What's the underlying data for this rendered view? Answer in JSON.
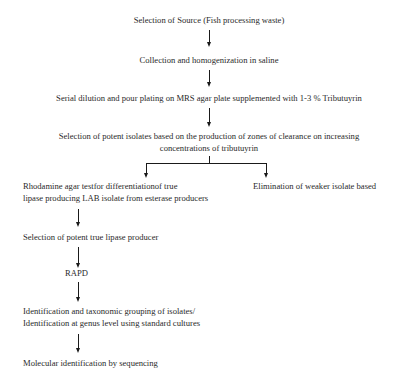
{
  "diagram": {
    "type": "flowchart",
    "nodes": {
      "source": "Selection of Source (Fish processing waste)",
      "collection": "Collection and homogenization in saline",
      "dilution": "Serial dilution and pour plating on MRS agar plate supplemented with 1-3 % Tributuyrin",
      "selection_line1": "Selection of potent isolates based on the production of zones of clearance on increasing",
      "selection_line2": "concentrations of tributuyrin",
      "rhodamine_line1": "Rhodamine agar testfor differentiationof true",
      "rhodamine_line2": "lipase producing LAB isolate from esterase producers",
      "elimination": "Elimination of weaker isolate based",
      "true_lipase": "Selection of potent true lipase producer",
      "rapd": "RAPD",
      "identification_line1": "Identification and taxonomic grouping of isolates/",
      "identification_line2": "Identification at genus level using standard cultures",
      "molecular": "Molecular identification by sequencing"
    },
    "edges": [
      [
        "source",
        "collection"
      ],
      [
        "collection",
        "dilution"
      ],
      [
        "dilution",
        "selection"
      ],
      [
        "selection",
        "rhodamine"
      ],
      [
        "selection",
        "elimination"
      ],
      [
        "rhodamine",
        "true_lipase"
      ],
      [
        "true_lipase",
        "rapd"
      ],
      [
        "rapd",
        "identification"
      ],
      [
        "identification",
        "molecular"
      ]
    ],
    "colors": {
      "line": "#1a1a1a",
      "text": "#2a2a2a",
      "background": "#ffffff"
    }
  }
}
